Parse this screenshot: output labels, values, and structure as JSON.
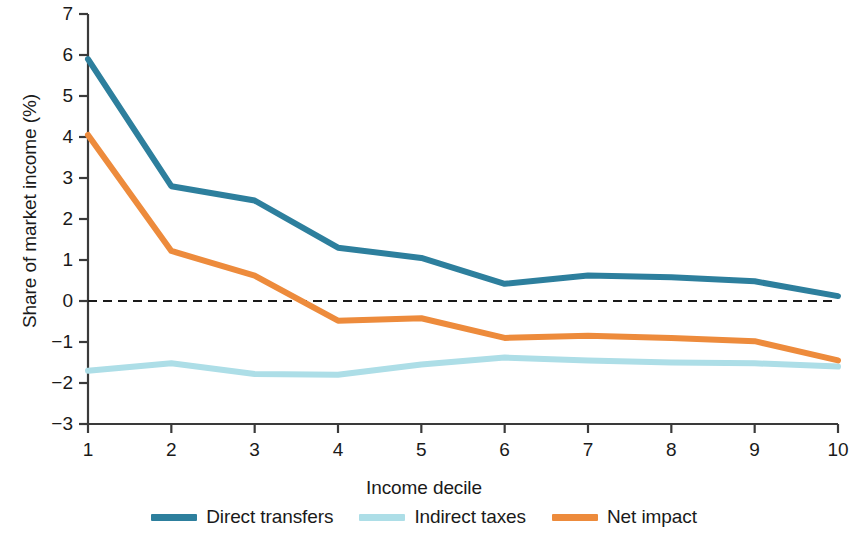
{
  "chart_data": {
    "type": "line",
    "title": "",
    "xlabel": "Income decile",
    "ylabel": "Share of market income (%)",
    "x": [
      1,
      2,
      3,
      4,
      5,
      6,
      7,
      8,
      9,
      10
    ],
    "xtick_labels": [
      "1",
      "2",
      "3",
      "4",
      "5",
      "6",
      "7",
      "8",
      "9",
      "10"
    ],
    "ytick_labels": [
      "7",
      "6",
      "5",
      "4",
      "3",
      "2",
      "1",
      "0",
      "−1",
      "−2",
      "−3"
    ],
    "ytick_values": [
      7,
      6,
      5,
      4,
      3,
      2,
      1,
      0,
      -1,
      -2,
      -3
    ],
    "xlim": [
      1,
      10
    ],
    "ylim": [
      -3,
      7
    ],
    "grid": false,
    "zero_line": true,
    "zero_line_style": "dashed",
    "zero_line_color": "#1a1a1a",
    "legend_position": "bottom",
    "series": [
      {
        "name": "Direct transfers",
        "color": "#2d7f9d",
        "values": [
          5.9,
          2.8,
          2.45,
          1.3,
          1.05,
          0.42,
          0.62,
          0.58,
          0.48,
          0.12
        ]
      },
      {
        "name": "Indirect taxes",
        "color": "#addee7",
        "values": [
          -1.7,
          -1.52,
          -1.78,
          -1.8,
          -1.55,
          -1.38,
          -1.45,
          -1.5,
          -1.52,
          -1.6
        ]
      },
      {
        "name": "Net impact",
        "color": "#ed8b3c",
        "values": [
          4.05,
          1.22,
          0.62,
          -0.48,
          -0.42,
          -0.9,
          -0.85,
          -0.9,
          -0.98,
          -1.45
        ]
      }
    ]
  },
  "legend": {
    "items": [
      {
        "label": "Direct transfers",
        "color": "#2d7f9d"
      },
      {
        "label": "Indirect taxes",
        "color": "#addee7"
      },
      {
        "label": "Net impact",
        "color": "#ed8b3c"
      }
    ]
  },
  "axis": {
    "y_title": "Share of market income (%)",
    "x_title": "Income decile"
  }
}
